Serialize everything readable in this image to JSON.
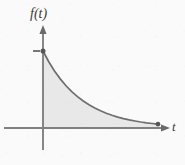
{
  "figure": {
    "width": 185,
    "height": 165,
    "background_color": "#fafafa",
    "y_axis_label": "f(t)",
    "x_axis_label": "t",
    "axis_color": "#808080",
    "curve_color": "#6e6e6e",
    "fill_color": "#e8e8e8",
    "marker_color": "#555555"
  },
  "chart_data": {
    "type": "line",
    "title": "",
    "xlabel": "t",
    "ylabel": "f(t)",
    "grid": false,
    "legend": null,
    "axis_arrows": true,
    "xlim": [
      0,
      1
    ],
    "ylim": [
      0,
      1
    ],
    "series": [
      {
        "name": "f(t)",
        "shaded_area_under_curve": true,
        "x": [
          0.0,
          0.05,
          0.1,
          0.15,
          0.2,
          0.25,
          0.3,
          0.35,
          0.4,
          0.45,
          0.5,
          0.55,
          0.6,
          0.65,
          0.7,
          0.75,
          0.8,
          0.85,
          0.9,
          0.95,
          1.0
        ],
        "y": [
          1.0,
          0.861,
          0.741,
          0.638,
          0.549,
          0.472,
          0.407,
          0.35,
          0.301,
          0.259,
          0.223,
          0.192,
          0.165,
          0.142,
          0.122,
          0.105,
          0.091,
          0.078,
          0.067,
          0.058,
          0.05
        ]
      }
    ],
    "markers": [
      {
        "name": "curve-start-point",
        "x": 0.0,
        "y": 1.0
      },
      {
        "name": "curve-end-point",
        "x": 1.0,
        "y": 0.05
      }
    ],
    "ticks": {
      "y": [
        {
          "value": 1.0,
          "label": ""
        }
      ],
      "x": []
    }
  }
}
